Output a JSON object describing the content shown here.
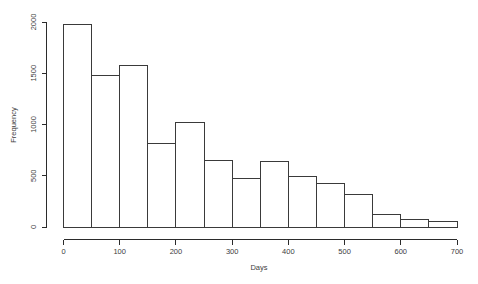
{
  "chart_data": {
    "type": "bar",
    "title": "",
    "subtitle": "",
    "xlabel": "Days",
    "ylabel": "Frequency",
    "xlim": [
      0,
      700
    ],
    "ylim": [
      0,
      2000
    ],
    "grid": false,
    "legend": null,
    "bin_width": 50,
    "bin_edges": [
      0,
      50,
      100,
      150,
      200,
      250,
      300,
      350,
      400,
      450,
      500,
      550,
      600,
      650,
      700
    ],
    "categories": [
      "0-50",
      "50-100",
      "100-150",
      "150-200",
      "200-250",
      "250-300",
      "300-350",
      "350-400",
      "400-450",
      "450-500",
      "500-550",
      "550-600",
      "600-650",
      "650-700"
    ],
    "values": [
      1980,
      1480,
      1575,
      810,
      1015,
      645,
      470,
      635,
      490,
      420,
      315,
      120,
      70,
      50
    ],
    "bar_midpoints": [
      25,
      75,
      125,
      175,
      225,
      275,
      325,
      375,
      425,
      475,
      525,
      575,
      625,
      675
    ],
    "x_ticks": [
      0,
      100,
      200,
      300,
      400,
      500,
      600,
      700
    ],
    "x_tick_labels": [
      "0",
      "100",
      "200",
      "300",
      "400",
      "500",
      "600",
      "700"
    ],
    "y_ticks": [
      0,
      500,
      1000,
      1500,
      2000
    ],
    "y_tick_labels": [
      "0",
      "500",
      "1000",
      "1500",
      "2000"
    ],
    "colors": {
      "bar_fill": "#ffffff",
      "bar_stroke": "#3a3a3a",
      "axis": "#2b2b2b",
      "text": "#3d3d3d",
      "background": "#ffffff"
    }
  },
  "axes": {
    "x_title": "Days",
    "y_title": "Frequency"
  }
}
